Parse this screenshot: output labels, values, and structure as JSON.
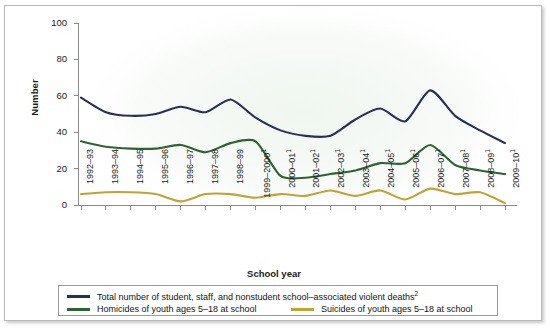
{
  "chart_data": {
    "type": "line",
    "title": "",
    "xlabel": "School year",
    "ylabel": "Number",
    "ylim": [
      0,
      100
    ],
    "yticks": [
      0,
      20,
      40,
      60,
      80,
      100
    ],
    "grid": false,
    "legend_position": "bottom",
    "categories": [
      "1992–93",
      "1993–94",
      "1994–95",
      "1995–96",
      "1996–97",
      "1997–98",
      "1998–99",
      "1999–2000",
      "2000–01",
      "2001–02",
      "2002–03",
      "2003–04",
      "2004–05",
      "2005–06",
      "2006–07",
      "2007–08",
      "2008–09",
      "2009–10"
    ],
    "category_footnotes": [
      "",
      "",
      "",
      "",
      "",
      "",
      "",
      "1",
      "1",
      "1",
      "1",
      "1",
      "1",
      "1",
      "1",
      "1",
      "1",
      "1"
    ],
    "series": [
      {
        "name": "Total number of student, staff, and nonstudent school–associated violent deaths",
        "footnote": "2",
        "color": "#2a3055",
        "values": [
          59,
          51,
          49,
          50,
          54,
          51,
          58,
          48,
          41,
          38,
          38,
          47,
          53,
          46,
          63,
          49,
          41,
          34
        ]
      },
      {
        "name": "Homicides of youth ages 5–18 at school",
        "footnote": "",
        "color": "#2d6332",
        "values": [
          35,
          32,
          31,
          31,
          33,
          29,
          34,
          35,
          16,
          15,
          17,
          19,
          23,
          23,
          33,
          22,
          19,
          17
        ]
      },
      {
        "name": "Suicides of youth ages 5–18 at school",
        "footnote": "",
        "color": "#bfa435",
        "values": [
          6,
          7,
          7,
          6,
          2,
          6,
          6,
          4,
          6,
          5,
          8,
          5,
          8,
          3,
          9,
          6,
          7,
          1
        ]
      }
    ]
  },
  "legend": {
    "entries": [
      {
        "label": "Total number of student, staff, and nonstudent school–associated violent deaths",
        "footnote": "2",
        "color": "#2a3055"
      },
      {
        "label": "Homicides of youth ages 5–18 at school",
        "footnote": "",
        "color": "#2d6332"
      },
      {
        "label": "Suicides of youth ages 5–18 at school",
        "footnote": "",
        "color": "#bfa435"
      }
    ]
  },
  "axes": {
    "y_title": "Number",
    "x_title": "School year"
  },
  "colors": {
    "total_line": "#2a3055",
    "homicides_line": "#2d6332",
    "suicides_line": "#bfa435",
    "axis": "#8a8a8a",
    "frame": "#b9b9b9",
    "text": "#1b1b1b"
  }
}
